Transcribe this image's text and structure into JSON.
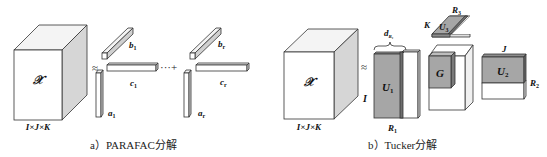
{
  "diagram": {
    "colors": {
      "stroke": "#333333",
      "face_front": "#ffffff",
      "face_side": "#d9d9d9",
      "face_top": "#f2f2f2",
      "factor_fill": "#a6a6a6",
      "factor_fill_dark": "#8c8c8c"
    },
    "parafac": {
      "tensor_label": "𝒳",
      "tensor_dims": "I×J×K",
      "approx_symbol": "≈",
      "components": [
        {
          "a": "a",
          "a_sub": "1",
          "b": "b",
          "b_sub": "1",
          "c": "c",
          "c_sub": "1"
        },
        {
          "a": "a",
          "a_sub": "r",
          "b": "b",
          "b_sub": "r",
          "c": "c",
          "c_sub": "r"
        }
      ],
      "sum_symbol": "···+",
      "caption": "a）PARAFAC分解"
    },
    "tucker": {
      "tensor_label": "𝒳",
      "tensor_dims": "I×J×K",
      "approx_symbol": "≈",
      "u1": {
        "label": "U",
        "sub": "1",
        "row_label": "I",
        "col_label": "R",
        "col_sub": "1",
        "brace_label": "d",
        "brace_sub": "R₁"
      },
      "u3": {
        "label": "U",
        "sub": "3",
        "side_label": "K",
        "top_label": "R",
        "top_sub": "3"
      },
      "core": {
        "label": "G"
      },
      "u2": {
        "label": "U",
        "sub": "2",
        "top_label": "J",
        "side_label": "R",
        "side_sub": "2"
      },
      "caption": "b）Tucker分解"
    }
  }
}
